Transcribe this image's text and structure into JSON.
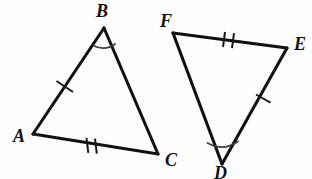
{
  "figure": {
    "type": "geometry-diagram",
    "background_color": "#fefefe",
    "stroke_color": "#111111",
    "arc_color": "#3d3d3d",
    "triangles": [
      {
        "id": "triangle-abc",
        "name": "Triangle ABC",
        "vertices": [
          {
            "label": "A",
            "x": 33,
            "y": 134,
            "label_x": 13,
            "label_y": 142
          },
          {
            "label": "B",
            "x": 104,
            "y": 28,
            "label_x": 96,
            "label_y": 17
          },
          {
            "label": "C",
            "x": 158,
            "y": 154,
            "label_x": 165,
            "label_y": 166
          }
        ],
        "sides": [
          {
            "name": "AB",
            "from": "A",
            "to": "B",
            "ticks": 1
          },
          {
            "name": "BC",
            "from": "B",
            "to": "C",
            "ticks": 0
          },
          {
            "name": "AC",
            "from": "A",
            "to": "C",
            "ticks": 2
          }
        ],
        "marked_angle": {
          "at": "B",
          "arcs": 1
        }
      },
      {
        "id": "triangle-fed",
        "name": "Triangle FED",
        "vertices": [
          {
            "label": "F",
            "x": 173,
            "y": 33,
            "label_x": 160,
            "label_y": 27
          },
          {
            "label": "E",
            "x": 287,
            "y": 48,
            "label_x": 294,
            "label_y": 50
          },
          {
            "label": "D",
            "x": 222,
            "y": 164,
            "label_x": 214,
            "label_y": 179
          }
        ],
        "sides": [
          {
            "name": "FE",
            "from": "F",
            "to": "E",
            "ticks": 2
          },
          {
            "name": "ED",
            "from": "E",
            "to": "D",
            "ticks": 1
          },
          {
            "name": "FD",
            "from": "F",
            "to": "D",
            "ticks": 0
          }
        ],
        "marked_angle": {
          "at": "D",
          "arcs": 1
        }
      }
    ],
    "labels": {
      "a": "A",
      "b": "B",
      "c": "C",
      "d": "D",
      "e": "E",
      "f": "F"
    }
  }
}
